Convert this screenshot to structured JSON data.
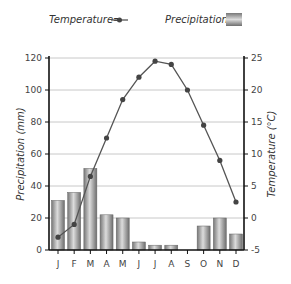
{
  "legend": {
    "temperature_label": "Temperature=",
    "precipitation_label": "Precipitation="
  },
  "colors": {
    "line": "#555555",
    "marker": "#444444",
    "bar_dark": "#7a7a7a",
    "bar_light": "#d8d8d8",
    "grid": "#c8c8c8",
    "axis": "#111111"
  },
  "chart_data": {
    "type": "bar+line",
    "title": "",
    "categories": [
      "J",
      "F",
      "M",
      "A",
      "M",
      "J",
      "J",
      "A",
      "S",
      "O",
      "N",
      "D"
    ],
    "series": [
      {
        "name": "Precipitation",
        "type": "bar",
        "axis": "left",
        "unit": "mm",
        "values": [
          31,
          36,
          51,
          22,
          20,
          5,
          3,
          3,
          0,
          15,
          20,
          10
        ]
      },
      {
        "name": "Temperature",
        "type": "line",
        "axis": "right",
        "unit": "°C",
        "values": [
          -3,
          -1,
          6.5,
          12.5,
          18.5,
          22,
          24.5,
          24,
          20,
          14.5,
          9,
          2.5
        ]
      }
    ],
    "xlabel": "",
    "ylabel_left": "Precipitation (mm)",
    "ylabel_right": "Temperature (°C)",
    "ylim_left": [
      0,
      120
    ],
    "yticks_left": [
      0,
      20,
      40,
      60,
      80,
      100,
      120
    ],
    "ylim_right": [
      -5,
      25
    ],
    "yticks_right": [
      -5,
      0,
      5,
      10,
      15,
      20,
      25
    ],
    "grid": true,
    "legend_position": "top"
  }
}
